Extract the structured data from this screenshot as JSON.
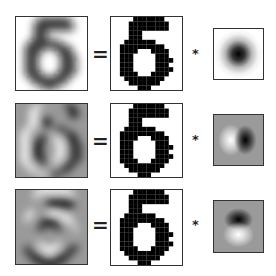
{
  "figure": {
    "operators": {
      "equals": "=",
      "convolve": "*"
    },
    "digit_label": "5",
    "binary_digit": {
      "grid_size": 16,
      "rows": [
        "0000011111110000",
        "0000111111111000",
        "0000111111111000",
        "0000111000000000",
        "0000111000000000",
        "0001111111000000",
        "0011111111110000",
        "0011110001111000",
        "0011100000111000",
        "0011100000111100",
        "0011100000111000",
        "0011100000111100",
        "0011110001111000",
        "0001111111110000",
        "0000111111100000",
        "0000001110000000"
      ]
    },
    "rows": [
      {
        "name": "gaussian",
        "result": "blurred",
        "kernel": "gaussian-blob"
      },
      {
        "name": "x-derivative",
        "result": "horizontal-derivative",
        "kernel": "dark-right-light-left"
      },
      {
        "name": "y-derivative",
        "result": "vertical-derivative",
        "kernel": "dark-top-light-bottom"
      }
    ],
    "colors": {
      "border": "#333333",
      "ink": "#000000",
      "paper": "#ffffff",
      "mid_gray": "#9a9a9a"
    }
  }
}
